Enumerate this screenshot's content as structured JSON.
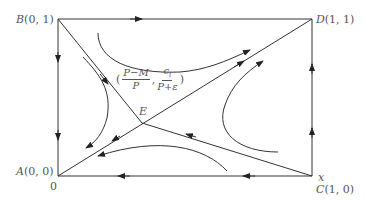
{
  "diagram": {
    "type": "phase-portrait",
    "points": {
      "A": {
        "name": "A",
        "coords": "(0, 0)"
      },
      "B": {
        "name": "B",
        "coords": "(0, 1)"
      },
      "C": {
        "name": "C",
        "coords": "(1, 0)"
      },
      "D": {
        "name": "D",
        "coords": "(1, 1)"
      },
      "E": {
        "name": "E"
      }
    },
    "axis": {
      "x_label": "x",
      "origin_label": "0"
    },
    "equilibrium_label": {
      "open": "(",
      "frac1_num": "P−M",
      "frac1_den": "P",
      "sep": ",",
      "frac2_num": "c",
      "frac2_num_sub": "i",
      "frac2_den": "P+ε",
      "close": ")"
    },
    "colors": {
      "line": "#333333",
      "text": "#555555",
      "background": "#ffffff"
    }
  }
}
